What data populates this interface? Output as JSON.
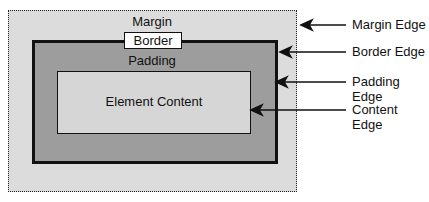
{
  "diagram": {
    "boxes": {
      "margin": "Margin",
      "border": "Border",
      "padding": "Padding",
      "content": "Element Content"
    },
    "edges": [
      {
        "label": "Margin Edge"
      },
      {
        "label": "Border Edge"
      },
      {
        "label": "Padding Edge"
      },
      {
        "label": "Content Edge"
      }
    ]
  }
}
